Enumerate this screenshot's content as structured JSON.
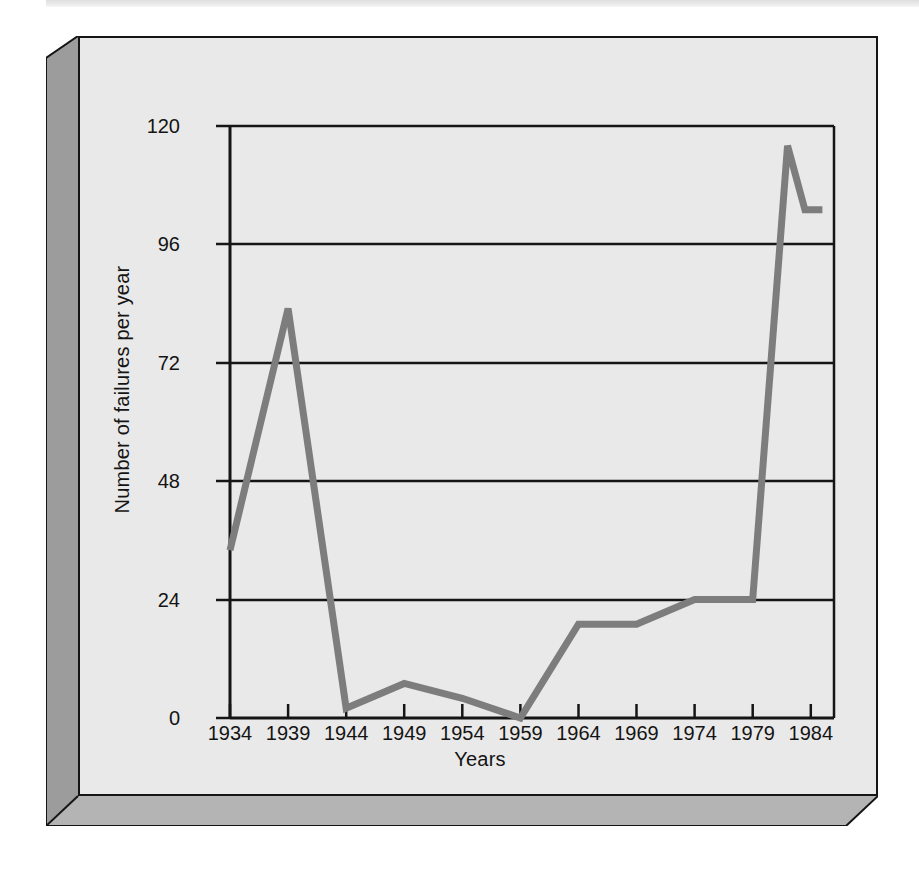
{
  "figure": {
    "frame_style": "3d-beveled-slab",
    "panel_background": "#e9e9e9",
    "border_color": "#151515",
    "slab_side_color": "#9c9c9c",
    "slab_bottom_color": "#b4b4b4"
  },
  "chart_data": {
    "type": "line",
    "title": "",
    "xlabel": "Years",
    "ylabel": "Number of failures per year",
    "xlim": [
      1934,
      1986
    ],
    "ylim": [
      0,
      120
    ],
    "yticks": [
      0,
      24,
      48,
      72,
      96,
      120
    ],
    "ytick_labels": [
      "0",
      "24",
      "48",
      "72",
      "96",
      "120"
    ],
    "xticks": [
      1934,
      1939,
      1944,
      1949,
      1954,
      1959,
      1964,
      1969,
      1974,
      1979,
      1984
    ],
    "xtick_labels": [
      "1934",
      "1939",
      "1944",
      "1949",
      "1954",
      "1959",
      "1964",
      "1969",
      "1974",
      "1979",
      "1984"
    ],
    "grid": "horizontal",
    "legend": "none",
    "line_color": "#7d7d7d",
    "line_width": 7,
    "x": [
      1934,
      1939,
      1944,
      1949,
      1954,
      1959,
      1964,
      1969,
      1974,
      1979,
      1982,
      1983.5,
      1985
    ],
    "values": [
      34,
      83,
      2,
      7,
      4,
      0,
      19,
      19,
      24,
      24,
      116,
      103,
      103
    ],
    "series": [
      {
        "name": "Number of failures per year",
        "x": [
          1934,
          1939,
          1944,
          1949,
          1954,
          1959,
          1964,
          1969,
          1974,
          1979,
          1982,
          1983.5,
          1985
        ],
        "values": [
          34,
          83,
          2,
          7,
          4,
          0,
          19,
          19,
          24,
          24,
          116,
          103,
          103
        ]
      }
    ],
    "annotations": []
  }
}
